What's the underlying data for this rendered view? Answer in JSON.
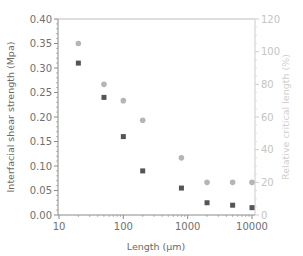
{
  "chart_data": {
    "type": "scatter",
    "title": "",
    "xlabel": "Length (μm)",
    "ylabel": "Interfacial shear strength (Mpa)",
    "y2label": "Relative critical length (%)",
    "xscale": "log",
    "xlim": [
      10,
      10000
    ],
    "ylim": [
      0,
      0.4
    ],
    "y2lim": [
      0,
      120
    ],
    "x_ticks": [
      10,
      100,
      1000,
      10000
    ],
    "x_tick_labels": [
      "10",
      "100",
      "1000",
      "10000"
    ],
    "y_ticks": [
      0,
      0.05,
      0.1,
      0.15,
      0.2,
      0.25,
      0.3,
      0.35,
      0.4
    ],
    "y_tick_labels": [
      "0.00",
      "0.05",
      "0.10",
      "0.15",
      "0.20",
      "0.25",
      "0.30",
      "0.35",
      "0.40"
    ],
    "y2_ticks": [
      0,
      20,
      40,
      60,
      80,
      100,
      120
    ],
    "y2_tick_labels": [
      "0",
      "20",
      "40",
      "60",
      "80",
      "100",
      "120"
    ],
    "grid": false,
    "legend": null,
    "x": [
      20,
      50,
      100,
      200,
      800,
      2000,
      5000,
      10000
    ],
    "series": [
      {
        "name": "Interfacial shear strength",
        "axis": "left",
        "marker": "square",
        "color": "#555555",
        "values": [
          0.31,
          0.24,
          0.16,
          0.09,
          0.055,
          0.025,
          0.02,
          0.015
        ]
      },
      {
        "name": "Relative critical length",
        "axis": "right",
        "marker": "circle",
        "color": "#b5b5b5",
        "values": [
          105,
          80,
          70,
          58,
          35,
          20,
          20,
          20
        ]
      }
    ]
  },
  "colors": {
    "axis_left": "#8a8a8a",
    "axis_right": "#cccccc",
    "frame": "#bdbdbd"
  }
}
